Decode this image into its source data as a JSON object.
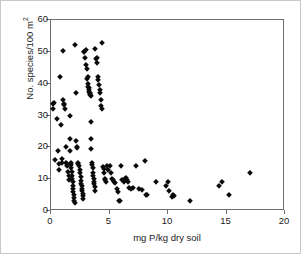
{
  "chart_data": {
    "type": "scatter",
    "title": "",
    "xlabel": "mg P/kg dry soil",
    "ylabel_prefix": "No. species/100 m",
    "ylabel_sup": "2",
    "xlim": [
      0,
      20
    ],
    "ylim": [
      0,
      60
    ],
    "xticks": [
      0,
      5,
      10,
      15,
      20
    ],
    "yticks": [
      0,
      10,
      20,
      30,
      40,
      50,
      60
    ],
    "grid": false,
    "legend": "none",
    "marker": "diamond",
    "marker_color": "#0a0a0a",
    "series": [
      {
        "name": "plots",
        "points": [
          [
            0.15,
            33.5
          ],
          [
            0.2,
            32.0
          ],
          [
            0.25,
            34.0
          ],
          [
            0.3,
            15.9
          ],
          [
            0.55,
            29.0
          ],
          [
            0.6,
            18.8
          ],
          [
            0.65,
            14.8
          ],
          [
            0.7,
            13.0
          ],
          [
            0.8,
            42.2
          ],
          [
            0.85,
            27.0
          ],
          [
            0.9,
            16.2
          ],
          [
            0.95,
            15.0
          ],
          [
            1.0,
            50.2
          ],
          [
            1.05,
            34.8
          ],
          [
            1.1,
            33.2
          ],
          [
            1.15,
            33.6
          ],
          [
            1.2,
            32.0
          ],
          [
            1.25,
            20.0
          ],
          [
            1.3,
            15.2
          ],
          [
            1.35,
            14.8
          ],
          [
            1.4,
            14.0
          ],
          [
            1.45,
            12.4
          ],
          [
            1.5,
            11.0
          ],
          [
            1.55,
            9.8
          ],
          [
            1.6,
            30.0
          ],
          [
            1.62,
            22.5
          ],
          [
            1.65,
            19.0
          ],
          [
            1.7,
            15.2
          ],
          [
            1.72,
            14.6
          ],
          [
            1.75,
            13.4
          ],
          [
            1.78,
            12.2
          ],
          [
            1.8,
            11.0
          ],
          [
            1.82,
            10.0
          ],
          [
            1.85,
            9.0
          ],
          [
            1.88,
            8.0
          ],
          [
            1.9,
            7.0
          ],
          [
            1.92,
            6.0
          ],
          [
            1.95,
            5.0
          ],
          [
            1.98,
            4.0
          ],
          [
            2.0,
            3.0
          ],
          [
            2.02,
            2.4
          ],
          [
            2.05,
            52.2
          ],
          [
            2.1,
            37.0
          ],
          [
            2.15,
            22.0
          ],
          [
            2.2,
            20.2
          ],
          [
            2.25,
            19.8
          ],
          [
            2.3,
            15.0
          ],
          [
            2.35,
            14.8
          ],
          [
            2.4,
            14.2
          ],
          [
            2.45,
            13.0
          ],
          [
            2.5,
            11.8
          ],
          [
            2.55,
            10.6
          ],
          [
            2.58,
            9.4
          ],
          [
            2.6,
            8.6
          ],
          [
            2.62,
            7.8
          ],
          [
            2.65,
            7.0
          ],
          [
            2.68,
            6.2
          ],
          [
            2.7,
            5.4
          ],
          [
            2.72,
            4.6
          ],
          [
            2.75,
            3.8
          ],
          [
            2.8,
            50.0
          ],
          [
            2.85,
            49.8
          ],
          [
            2.9,
            48.0
          ],
          [
            2.95,
            50.6
          ],
          [
            3.0,
            45.8
          ],
          [
            3.05,
            44.5
          ],
          [
            3.1,
            41.5
          ],
          [
            3.15,
            42.0
          ],
          [
            3.18,
            40.0
          ],
          [
            3.2,
            39.0
          ],
          [
            3.22,
            38.5
          ],
          [
            3.25,
            38.0
          ],
          [
            3.28,
            37.5
          ],
          [
            3.3,
            37.2
          ],
          [
            3.32,
            36.8
          ],
          [
            3.35,
            36.4
          ],
          [
            3.38,
            36.0
          ],
          [
            3.4,
            28.0
          ],
          [
            3.42,
            22.6
          ],
          [
            3.45,
            19.4
          ],
          [
            3.48,
            15.0
          ],
          [
            3.5,
            14.4
          ],
          [
            3.55,
            13.6
          ],
          [
            3.6,
            12.0
          ],
          [
            3.62,
            11.0
          ],
          [
            3.65,
            10.0
          ],
          [
            3.68,
            9.2
          ],
          [
            3.7,
            8.4
          ],
          [
            3.72,
            7.4
          ],
          [
            3.75,
            6.4
          ],
          [
            3.8,
            51.0
          ],
          [
            3.85,
            47.8
          ],
          [
            3.9,
            46.5
          ],
          [
            3.95,
            48.2
          ],
          [
            4.0,
            42.0
          ],
          [
            4.05,
            41.0
          ],
          [
            4.1,
            39.5
          ],
          [
            4.15,
            38.0
          ],
          [
            4.2,
            37.0
          ],
          [
            4.25,
            35.0
          ],
          [
            4.3,
            33.0
          ],
          [
            4.35,
            32.0
          ],
          [
            4.4,
            52.8
          ],
          [
            4.45,
            13.8
          ],
          [
            4.5,
            13.2
          ],
          [
            4.55,
            12.0
          ],
          [
            4.6,
            10.2
          ],
          [
            4.65,
            9.8
          ],
          [
            4.7,
            9.0
          ],
          [
            4.8,
            14.2
          ],
          [
            4.9,
            13.0
          ],
          [
            5.0,
            14.0
          ],
          [
            5.1,
            11.8
          ],
          [
            5.2,
            10.0
          ],
          [
            5.3,
            9.8
          ],
          [
            5.4,
            9.2
          ],
          [
            5.5,
            8.8
          ],
          [
            5.6,
            7.0
          ],
          [
            5.7,
            6.0
          ],
          [
            5.8,
            3.0
          ],
          [
            5.9,
            3.0
          ],
          [
            6.0,
            14.0
          ],
          [
            6.1,
            9.8
          ],
          [
            6.2,
            9.0
          ],
          [
            6.3,
            10.0
          ],
          [
            6.4,
            10.4
          ],
          [
            6.5,
            9.6
          ],
          [
            6.6,
            9.0
          ],
          [
            6.7,
            7.2
          ],
          [
            6.8,
            6.8
          ],
          [
            7.0,
            7.2
          ],
          [
            7.3,
            14.2
          ],
          [
            7.5,
            7.0
          ],
          [
            7.8,
            6.6
          ],
          [
            8.0,
            15.8
          ],
          [
            8.1,
            5.0
          ],
          [
            8.2,
            5.0
          ],
          [
            9.0,
            9.0
          ],
          [
            9.8,
            8.0
          ],
          [
            10.0,
            9.2
          ],
          [
            10.1,
            6.2
          ],
          [
            10.3,
            4.4
          ],
          [
            10.4,
            5.0
          ],
          [
            10.5,
            4.6
          ],
          [
            11.9,
            3.0
          ],
          [
            14.4,
            8.0
          ],
          [
            14.6,
            9.0
          ],
          [
            15.2,
            5.0
          ],
          [
            17.0,
            11.8
          ]
        ]
      }
    ]
  },
  "axes": {
    "x_tick_labels": [
      "0",
      "5",
      "10",
      "15",
      "20"
    ],
    "y_tick_labels": [
      "0",
      "10",
      "20",
      "30",
      "40",
      "50",
      "60"
    ]
  }
}
